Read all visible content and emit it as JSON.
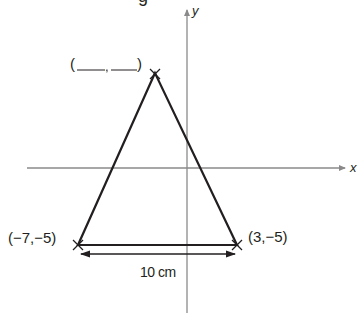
{
  "header": {
    "cropped_text_fragment": "g"
  },
  "diagram": {
    "type": "triangle-on-coordinate-axes",
    "axes": {
      "x_label": "x",
      "y_label": "y",
      "axis_color": "#8a8a8a"
    },
    "vertices": {
      "apex": {
        "label": "(____,____)"
      },
      "bottom_left": {
        "label": "(−7,−5)"
      },
      "bottom_right": {
        "label": "(3,−5)"
      }
    },
    "base_measurement": "10 cm",
    "line_color": "#231f20"
  }
}
